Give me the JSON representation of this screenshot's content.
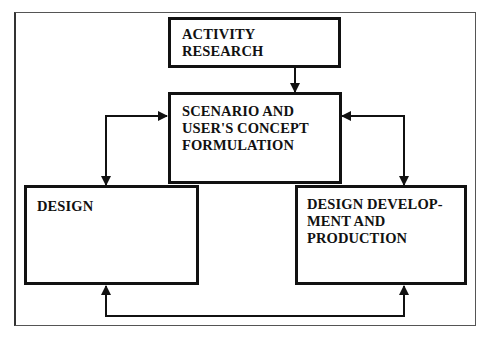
{
  "diagram": {
    "nodes": {
      "activity_research": {
        "label": "ACTIVITY\nRESEARCH"
      },
      "scenario": {
        "label": "SCENARIO AND\nUSER'S CONCEPT\nFORMULATION"
      },
      "design": {
        "label": "DESIGN"
      },
      "development": {
        "label": "DESIGN DEVELOP-\nMENT AND\nPRODUCTION"
      }
    },
    "edges": [
      {
        "from": "activity_research",
        "to": "scenario",
        "direction": "one-way"
      },
      {
        "from": "scenario",
        "to": "design",
        "direction": "two-way"
      },
      {
        "from": "scenario",
        "to": "development",
        "direction": "two-way"
      },
      {
        "from": "design",
        "to": "development",
        "direction": "two-way"
      }
    ],
    "colors": {
      "line": "#111111",
      "background": "#ffffff",
      "frame": "#555555"
    }
  }
}
